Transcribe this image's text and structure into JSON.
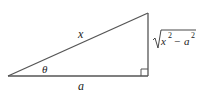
{
  "diagram": {
    "type": "right-triangle",
    "labels": {
      "hypotenuse": "x",
      "angle": "θ",
      "adjacent": "a",
      "opposite_base_x": "x",
      "opposite_base_a": "a",
      "opposite_exp": "2",
      "opposite_minus": "−",
      "opposite_full": "√(x² − a²)"
    },
    "vertices": {
      "left": [
        8,
        76
      ],
      "right_bottom": [
        148,
        76
      ],
      "top": [
        148,
        13
      ]
    },
    "line_color": "#555555",
    "right_angle_marker": true
  }
}
